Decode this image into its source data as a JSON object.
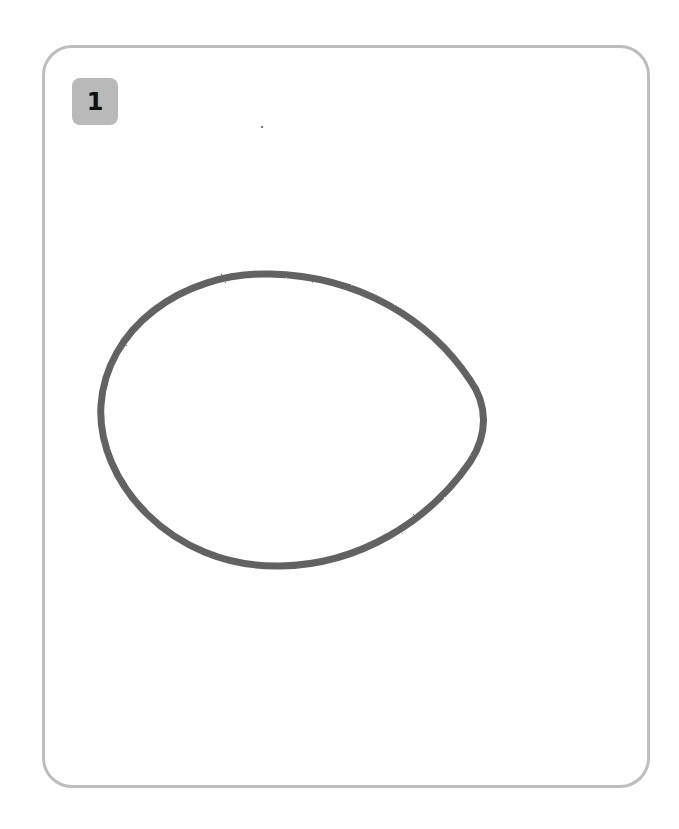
{
  "card": {
    "number_badge": "1",
    "border_color": "#bdbdbd",
    "badge_color": "#b9b9b9"
  },
  "drawing": {
    "shape": "egg-shaped closed oval outline (pencil stroke)",
    "stroke_color": "#555555",
    "path": "M 270 274 C 180 272 106 330 101 405 C 96 480 170 568 280 566 C 360 565 430 520 470 462 C 488 435 488 405 470 380 C 430 320 360 276 270 274 Z"
  }
}
